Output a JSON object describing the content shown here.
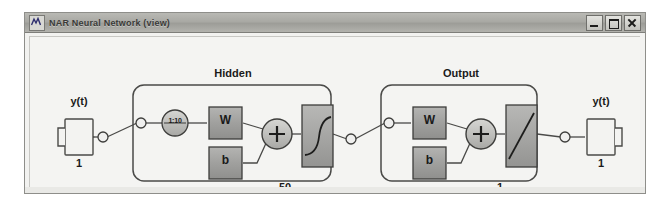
{
  "window": {
    "title": "NAR Neural Network (view)",
    "icon": "matlab-wave-icon",
    "buttons": {
      "minimize": "minimize-button",
      "maximize": "maximize-button",
      "close": "close-button"
    }
  },
  "diagram": {
    "type": "neural-network-architecture",
    "input": {
      "label": "y(t)",
      "size": "1"
    },
    "output": {
      "label": "y(t)",
      "size": "1"
    },
    "layers": [
      {
        "title": "Hidden",
        "delay": "1:10",
        "weight_label": "W",
        "bias_label": "b",
        "sum_label": "+",
        "transfer_function": "tansig",
        "neuron_count": "50"
      },
      {
        "title": "Output",
        "weight_label": "W",
        "bias_label": "b",
        "sum_label": "+",
        "transfer_function": "purelin",
        "neuron_count": "1"
      }
    ]
  },
  "colors": {
    "titlebar": "#a9a9a4",
    "canvas": "#f4f4f2",
    "block_fill": "#9e9e9c",
    "layer_border": "#6e6e6c",
    "text": "#1a1a1a"
  }
}
